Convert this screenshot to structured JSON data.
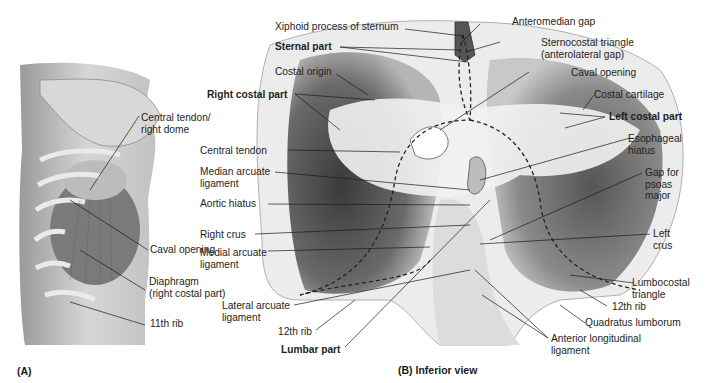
{
  "figure": {
    "panel_a": {
      "caption": "(A)",
      "labels": {
        "central_tendon_right_dome": "Central tendon/\nright dome",
        "caval_opening": "Caval opening",
        "diaphragm_right_costal": "Diaphragm\n(right costal part)",
        "rib_11": "11th rib"
      }
    },
    "panel_b": {
      "caption": "(B) Inferior view",
      "labels": {
        "xiphoid": "Xiphoid process of sternum",
        "sternal_part": "Sternal part",
        "costal_origin": "Costal origin",
        "right_costal_part": "Right costal part",
        "central_tendon": "Central tendon",
        "median_arcuate": "Median arcuate\nligament",
        "aortic_hiatus": "Aortic hiatus",
        "right_crus": "Right crus",
        "medial_arcuate": "Medial arcuate\nligament",
        "lateral_arcuate": "Lateral arcuate\nligament",
        "rib_12_left": "12th rib",
        "lumbar_part": "Lumbar part",
        "anteromedian_gap": "Anteromedian gap",
        "sternocostal_triangle": "Sternocostal triangle\n(anterolateral gap)",
        "caval_opening": "Caval opening",
        "costal_cartilage": "Costal cartilage",
        "left_costal_part": "Left costal part",
        "esophageal_hiatus": "Esophageal\nhiatus",
        "gap_psoas": "Gap for\npsoas\nmajor",
        "left_crus": "Left\ncrus",
        "lumbocostal_triangle": "Lumbocostal\ntriangle",
        "rib_12_right": "12th rib",
        "quadratus_lumborum": "Quadratus lumborum",
        "anterior_longitudinal": "Anterior longitudinal\nligament"
      }
    }
  }
}
